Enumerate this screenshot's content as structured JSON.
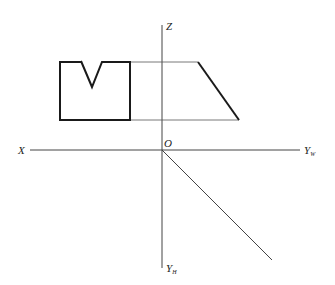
{
  "diagram": {
    "type": "orthographic-projection",
    "axes": {
      "x_label": "X",
      "z_label": "Z",
      "origin_label": "O",
      "yw_label": "Y",
      "yw_sub": "W",
      "yh_label": "Y",
      "yh_sub": "H"
    },
    "views": {
      "front_view": "rectangle with V-notch on top",
      "side_view": "trapezoid with slanted right edge"
    },
    "colors": {
      "line": "#1a1a1a",
      "thin_line": "#444444",
      "background": "#ffffff"
    }
  }
}
